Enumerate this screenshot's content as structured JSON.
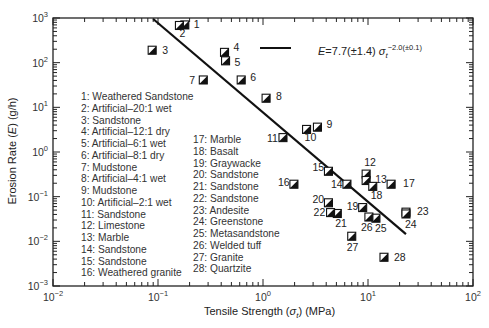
{
  "chart_data": {
    "type": "scatter",
    "title": "",
    "xlabel": "Tensile Strength (σt) (MPa)",
    "ylabel": "Erosion Rate (E) (g/h)",
    "xscale": "log",
    "yscale": "log",
    "xlim": [
      0.01,
      100
    ],
    "ylim": [
      0.001,
      1000
    ],
    "x_ticks": [
      "10^-2",
      "10^-1",
      "10^0",
      "10^1",
      "10^2"
    ],
    "y_ticks": [
      "10^-3",
      "10^-2",
      "10^-1",
      "10^0",
      "10^1",
      "10^2",
      "10^3"
    ],
    "grid": false,
    "fit_line": {
      "label": "E = 7.7(±1.4) σt^-2.0(±0.1)",
      "coefficient": 7.7,
      "coefficient_err": 1.4,
      "exponent": -2.0,
      "exponent_err": 0.1,
      "x_range": [
        0.09,
        23
      ]
    },
    "points": [
      {
        "id": 1,
        "name": "Weathered Sandstone",
        "x": 0.18,
        "y": 700
      },
      {
        "id": 2,
        "name": "Artificial–20:1 wet",
        "x": 0.16,
        "y": 680
      },
      {
        "id": 3,
        "name": "Sandstone",
        "x": 0.088,
        "y": 190
      },
      {
        "id": 4,
        "name": "Artificial–12:1 dry",
        "x": 0.43,
        "y": 170
      },
      {
        "id": 5,
        "name": "Artificial–6:1 wet",
        "x": 0.44,
        "y": 110
      },
      {
        "id": 6,
        "name": "Artificial–8:1 dry",
        "x": 0.62,
        "y": 41
      },
      {
        "id": 7,
        "name": "Mudstone",
        "x": 0.27,
        "y": 41
      },
      {
        "id": 8,
        "name": "Artificial–4:1 wet",
        "x": 1.07,
        "y": 16
      },
      {
        "id": 9,
        "name": "Mudstone",
        "x": 3.3,
        "y": 3.6
      },
      {
        "id": 10,
        "name": "Artificial–2:1 wet",
        "x": 2.6,
        "y": 3.2
      },
      {
        "id": 11,
        "name": "Sandstone",
        "x": 1.55,
        "y": 2.1
      },
      {
        "id": 12,
        "name": "Limestone",
        "x": 9.6,
        "y": 0.32
      },
      {
        "id": 13,
        "name": "Marble",
        "x": 9.6,
        "y": 0.23
      },
      {
        "id": 14,
        "name": "Sandstone",
        "x": 6.3,
        "y": 0.19
      },
      {
        "id": 15,
        "name": "Sandstone",
        "x": 4.2,
        "y": 0.37
      },
      {
        "id": 16,
        "name": "Weathered granite",
        "x": 1.97,
        "y": 0.19
      },
      {
        "id": 17,
        "name": "Marble",
        "x": 16.6,
        "y": 0.19
      },
      {
        "id": 18,
        "name": "Basalt",
        "x": 11.1,
        "y": 0.17
      },
      {
        "id": 19,
        "name": "Graywacke",
        "x": 8.9,
        "y": 0.057
      },
      {
        "id": 20,
        "name": "Sandstone",
        "x": 4.2,
        "y": 0.073
      },
      {
        "id": 21,
        "name": "Sandstone",
        "x": 5.1,
        "y": 0.042
      },
      {
        "id": 22,
        "name": "Sandstone",
        "x": 4.4,
        "y": 0.044
      },
      {
        "id": 23,
        "name": "Andesite",
        "x": 23,
        "y": 0.045
      },
      {
        "id": 24,
        "name": "Greenstone",
        "x": 23,
        "y": 0.041
      },
      {
        "id": 25,
        "name": "Metasandstone",
        "x": 11.9,
        "y": 0.033
      },
      {
        "id": 26,
        "name": "Welded tuff",
        "x": 10.2,
        "y": 0.035
      },
      {
        "id": 27,
        "name": "Granite",
        "x": 7.0,
        "y": 0.013
      },
      {
        "id": 28,
        "name": "Quartzite",
        "x": 14.2,
        "y": 0.0044
      }
    ],
    "legend_position": "inside-lower-left",
    "annotation_equation": {
      "prefix": "E = 7.7(±1.4) σ",
      "sub": "t",
      "sup": "−2.0(±0.1)"
    }
  },
  "axes": {
    "xlabel": "Tensile Strength (σt) (MPa)",
    "ylabel": "Erosion Rate (E) (g/h)"
  },
  "legend": {
    "col1": [
      "1: Weathered Sandstone",
      "2: Artificial–20:1 wet",
      "3: Sandstone",
      "4: Artificial–12:1 dry",
      "5: Artificial–6:1 wet",
      "6: Artificial–8:1 dry",
      "7: Mudstone",
      "8: Artificial–4:1 wet",
      "9: Mudstone",
      "10: Artificial–2:1 wet",
      "11: Sandstone",
      "12: Limestone",
      "13: Marble",
      "14: Sandstone",
      "15: Sandstone",
      "16: Weathered granite"
    ],
    "col2": [
      "17: Marble",
      "18: Basalt",
      "19: Graywacke",
      "20: Sandstone",
      "21: Sandstone",
      "22: Sandstone",
      "23: Andesite",
      "24: Greenstone",
      "25: Metasandstone",
      "26: Welded tuff",
      "27: Granite",
      "28: Quartzite"
    ]
  }
}
